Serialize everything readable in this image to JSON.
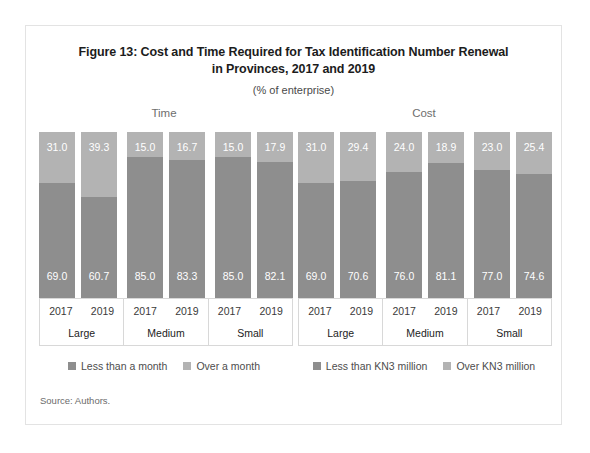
{
  "figure": {
    "title_line1": "Figure 13: Cost and Time Required for Tax Identification Number Renewal",
    "title_line2": "in Provinces, 2017 and 2019",
    "subtitle": "(% of enterprise)",
    "source": "Source: Authors."
  },
  "colors": {
    "segment_top": "#b3b3b3",
    "segment_bottom": "#8e8e8e",
    "border": "#e3e3e3",
    "text": "#1c1c1c"
  },
  "chart_data": [
    {
      "type": "bar",
      "title": "Time",
      "stacked": true,
      "xlabel": "",
      "ylabel": "",
      "ylim": [
        0,
        100
      ],
      "grid": false,
      "legend_position": "bottom",
      "categories": [
        "2017",
        "2019",
        "2017",
        "2019",
        "2017",
        "2019"
      ],
      "groups": [
        "Large",
        "Medium",
        "Small"
      ],
      "series": [
        {
          "name": "Less than a month",
          "values": [
            69.0,
            60.7,
            85.0,
            83.3,
            85.0,
            82.1
          ]
        },
        {
          "name": "Over a month",
          "values": [
            31.0,
            39.3,
            15.0,
            16.7,
            15.0,
            17.9
          ]
        }
      ],
      "bars": [
        {
          "year": "2017",
          "group": "Large",
          "top_label": "31.0",
          "bottom_label": "69.0",
          "top_value": 31.0,
          "bottom_value": 69.0
        },
        {
          "year": "2019",
          "group": "Large",
          "top_label": "39.3",
          "bottom_label": "60.7",
          "top_value": 39.3,
          "bottom_value": 60.7
        },
        {
          "year": "2017",
          "group": "Medium",
          "top_label": "15.0",
          "bottom_label": "85.0",
          "top_value": 15.0,
          "bottom_value": 85.0
        },
        {
          "year": "2019",
          "group": "Medium",
          "top_label": "16.7",
          "bottom_label": "83.3",
          "top_value": 16.7,
          "bottom_value": 83.3
        },
        {
          "year": "2017",
          "group": "Small",
          "top_label": "15.0",
          "bottom_label": "85.0",
          "top_value": 15.0,
          "bottom_value": 85.0
        },
        {
          "year": "2019",
          "group": "Small",
          "top_label": "17.9",
          "bottom_label": "82.1",
          "top_value": 17.9,
          "bottom_value": 82.1
        }
      ],
      "legend": [
        {
          "label": "Less than a month",
          "color": "#8e8e8e"
        },
        {
          "label": "Over a month",
          "color": "#b3b3b3"
        }
      ]
    },
    {
      "type": "bar",
      "title": "Cost",
      "stacked": true,
      "xlabel": "",
      "ylabel": "",
      "ylim": [
        0,
        100
      ],
      "grid": false,
      "legend_position": "bottom",
      "categories": [
        "2017",
        "2019",
        "2017",
        "2019",
        "2017",
        "2019"
      ],
      "groups": [
        "Large",
        "Medium",
        "Small"
      ],
      "series": [
        {
          "name": "Less than KN3 million",
          "values": [
            69.0,
            70.6,
            76.0,
            81.1,
            77.0,
            74.6
          ]
        },
        {
          "name": "Over KN3 million",
          "values": [
            31.0,
            29.4,
            24.0,
            18.9,
            23.0,
            25.4
          ]
        }
      ],
      "bars": [
        {
          "year": "2017",
          "group": "Large",
          "top_label": "31.0",
          "bottom_label": "69.0",
          "top_value": 31.0,
          "bottom_value": 69.0
        },
        {
          "year": "2019",
          "group": "Large",
          "top_label": "29.4",
          "bottom_label": "70.6",
          "top_value": 29.4,
          "bottom_value": 70.6
        },
        {
          "year": "2017",
          "group": "Medium",
          "top_label": "24.0",
          "bottom_label": "76.0",
          "top_value": 24.0,
          "bottom_value": 76.0
        },
        {
          "year": "2019",
          "group": "Medium",
          "top_label": "18.9",
          "bottom_label": "81.1",
          "top_value": 18.9,
          "bottom_value": 81.1
        },
        {
          "year": "2017",
          "group": "Small",
          "top_label": "23.0",
          "bottom_label": "77.0",
          "top_value": 23.0,
          "bottom_value": 77.0
        },
        {
          "year": "2019",
          "group": "Small",
          "top_label": "25.4",
          "bottom_label": "74.6",
          "top_value": 25.4,
          "bottom_value": 74.6
        }
      ],
      "legend": [
        {
          "label": "Less than KN3 million",
          "color": "#8e8e8e"
        },
        {
          "label": "Over KN3 million",
          "color": "#b3b3b3"
        }
      ]
    }
  ]
}
